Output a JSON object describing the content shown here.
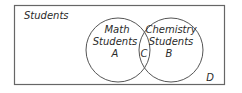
{
  "diagram": {
    "type": "venn",
    "universe_label": "Students",
    "sets": [
      {
        "id": "A",
        "title_line1": "Math",
        "title_line2": "Students",
        "region_label": "A"
      },
      {
        "id": "B",
        "title_line1": "Chemistry",
        "title_line2": "Students",
        "region_label": "B"
      }
    ],
    "intersection_label": "C",
    "outside_label": "D",
    "colors": {
      "stroke": "#555555",
      "text": "#2a2a2a",
      "background": "#ffffff"
    }
  }
}
